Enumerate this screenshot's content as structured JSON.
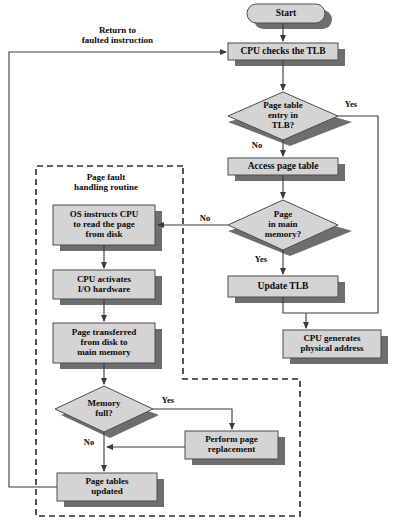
{
  "diagram": {
    "colors": {
      "node_fill": "#d4d4d4",
      "node_stroke": "#4d4d4d",
      "shadow": "#6e6e6e",
      "line": "#3a3a3a",
      "text": "#0a0a0a",
      "dashed_border": "#2b2b2b",
      "page_background": "#ffffff"
    },
    "nodes": [
      {
        "id": "start",
        "shape": "terminator",
        "label": "Start",
        "x": 247,
        "y": 4,
        "w": 78,
        "h": 19,
        "font": 9.5
      },
      {
        "id": "cpu_checks_tlb",
        "shape": "process",
        "label": "CPU checks the TLB",
        "x": 228,
        "y": 43,
        "w": 110,
        "h": 17,
        "font": 9.5
      },
      {
        "id": "pte_in_tlb",
        "shape": "decision",
        "label": "Page table\nentry in\nTLB?",
        "x": 228,
        "y": 92,
        "w": 110,
        "h": 48,
        "font": 9
      },
      {
        "id": "access_page_table",
        "shape": "process",
        "label": "Access page table",
        "x": 228,
        "y": 158,
        "w": 110,
        "h": 17,
        "font": 9.5
      },
      {
        "id": "page_in_main_mem",
        "shape": "decision",
        "label": "Page\nin main\nmemory?",
        "x": 228,
        "y": 200,
        "w": 110,
        "h": 50,
        "font": 9
      },
      {
        "id": "update_tlb",
        "shape": "process",
        "label": "Update TLB",
        "x": 228,
        "y": 276,
        "w": 110,
        "h": 21,
        "font": 9.5
      },
      {
        "id": "cpu_generates",
        "shape": "process",
        "label": "CPU generates\nphysical address",
        "x": 283,
        "y": 330,
        "w": 98,
        "h": 28,
        "font": 9
      },
      {
        "id": "os_instructs_cpu",
        "shape": "process",
        "label": "OS instructs CPU\nto read the page\nfrom disk",
        "x": 53,
        "y": 205,
        "w": 102,
        "h": 40,
        "font": 9
      },
      {
        "id": "cpu_activates_io",
        "shape": "process",
        "label": "CPU activates\nI/O hardware",
        "x": 53,
        "y": 270,
        "w": 102,
        "h": 29,
        "font": 9
      },
      {
        "id": "page_transferred",
        "shape": "process",
        "label": "Page transferred\nfrom disk to\nmain memory",
        "x": 53,
        "y": 323,
        "w": 102,
        "h": 40,
        "font": 9
      },
      {
        "id": "memory_full",
        "shape": "decision",
        "label": "Memory\nfull?",
        "x": 55,
        "y": 386,
        "w": 98,
        "h": 46,
        "font": 9
      },
      {
        "id": "perform_page_repl",
        "shape": "process",
        "label": "Perform page\nreplacement",
        "x": 185,
        "y": 431,
        "w": 93,
        "h": 28,
        "font": 9
      },
      {
        "id": "page_tables_upd",
        "shape": "process",
        "label": "Page tables\nupdated",
        "x": 57,
        "y": 473,
        "w": 100,
        "h": 28,
        "font": 9
      }
    ],
    "edge_labels": [
      {
        "id": "return-to-faulted",
        "text": "Return to\nfaulted instruction",
        "x": 55,
        "y": 25,
        "w": 125,
        "align": "center",
        "font": 9
      },
      {
        "id": "yes-tlb",
        "text": "Yes",
        "x": 340,
        "y": 100,
        "w": 22,
        "align": "left",
        "font": 8.5
      },
      {
        "id": "no-tlb",
        "text": "No",
        "x": 248,
        "y": 141,
        "w": 18,
        "align": "left",
        "font": 8.5
      },
      {
        "id": "no-main-mem",
        "text": "No",
        "x": 196,
        "y": 214,
        "w": 18,
        "align": "left",
        "font": 8.5
      },
      {
        "id": "yes-main-mem",
        "text": "Yes",
        "x": 250,
        "y": 255,
        "w": 22,
        "align": "left",
        "font": 8.5
      },
      {
        "id": "yes-mem-full",
        "text": "Yes",
        "x": 157,
        "y": 396,
        "w": 22,
        "align": "left",
        "font": 8.5
      },
      {
        "id": "no-mem-full",
        "text": "No",
        "x": 80,
        "y": 438,
        "w": 18,
        "align": "left",
        "font": 8.5
      }
    ],
    "group_label": {
      "id": "page-fault-routine",
      "text": "Page fault\nhandling routine",
      "x": 46,
      "y": 172,
      "w": 120
    },
    "dashed_regions": [
      {
        "id": "page-fault-region-upper",
        "x": 36,
        "y": 166,
        "w": 147,
        "h": 213
      },
      {
        "id": "page-fault-region-lower",
        "x": 36,
        "y": 379,
        "w": 264,
        "h": 137
      }
    ]
  }
}
